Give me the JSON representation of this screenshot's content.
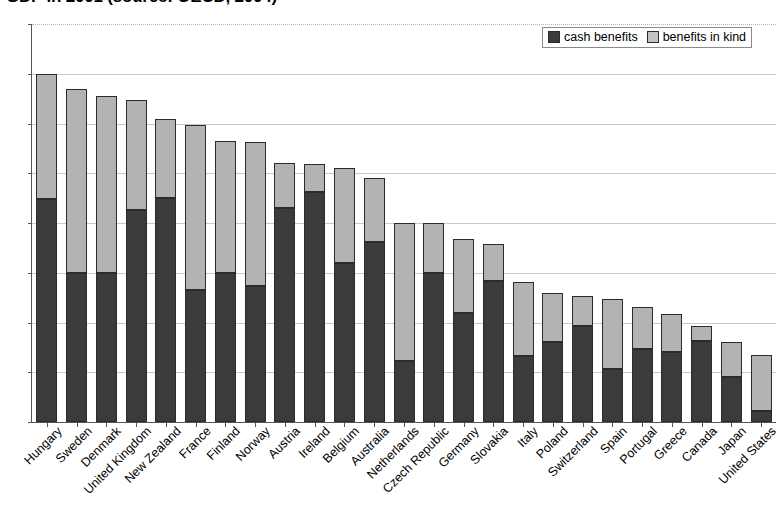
{
  "chart_data": {
    "type": "bar",
    "subtype": "stacked-column",
    "title": "GDP in 2001 (source: OECD, 2004)",
    "xlabel": "",
    "ylabel": "",
    "ylim": [
      0,
      4
    ],
    "ytick_labels": [
      "0",
      "0,5",
      "1",
      "1,5",
      "2",
      "2,5",
      "3",
      "3,5",
      "4"
    ],
    "ytick_values": [
      0,
      0.5,
      1,
      1.5,
      2,
      2.5,
      3,
      3.5,
      4
    ],
    "grid": true,
    "legend_position": "top-right",
    "categories": [
      "Hungary",
      "Sweden",
      "Denmark",
      "United Kingdom",
      "New Zealand",
      "France",
      "Finland",
      "Norway",
      "Austria",
      "Ireland",
      "Belgium",
      "Australia",
      "Netherlands",
      "Czech Republic",
      "Germany",
      "Slovakia",
      "Italy",
      "Poland",
      "Switzerland",
      "Spain",
      "Portugal",
      "Greece",
      "Canada",
      "Japan",
      "United States"
    ],
    "series": [
      {
        "name": "cash benefits",
        "color": "#3b3b3b",
        "values": [
          2.24,
          1.5,
          1.5,
          2.13,
          2.25,
          1.33,
          1.5,
          1.37,
          2.15,
          2.31,
          1.6,
          1.81,
          0.61,
          1.5,
          1.1,
          1.42,
          0.66,
          0.8,
          0.96,
          0.53,
          0.73,
          0.7,
          0.81,
          0.45,
          0.11
        ]
      },
      {
        "name": "benefits in kind",
        "color": "#b3b3b3",
        "values": [
          1.26,
          1.85,
          1.78,
          1.11,
          0.8,
          1.66,
          1.32,
          1.44,
          0.45,
          0.28,
          0.95,
          0.64,
          1.39,
          0.5,
          0.74,
          0.37,
          0.75,
          0.5,
          0.31,
          0.71,
          0.43,
          0.39,
          0.16,
          0.35,
          0.56
        ]
      }
    ],
    "totals": [
      3.5,
      3.35,
      3.28,
      3.24,
      3.05,
      2.99,
      2.82,
      2.81,
      2.6,
      2.59,
      2.55,
      2.45,
      2.0,
      2.0,
      1.84,
      1.79,
      1.41,
      1.3,
      1.27,
      1.24,
      1.16,
      1.09,
      0.97,
      0.8,
      0.67
    ]
  },
  "legend": {
    "items": [
      {
        "label": "cash benefits",
        "swatch": "dark-square-icon"
      },
      {
        "label": "benefits in kind",
        "swatch": "light-square-icon"
      }
    ]
  }
}
